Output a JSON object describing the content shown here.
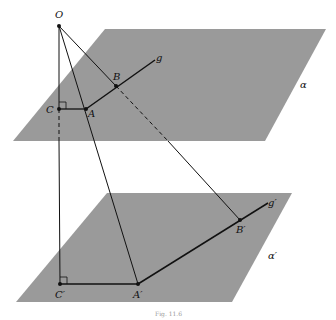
{
  "figure": {
    "caption": "Fig. 11.6",
    "colors": {
      "plane": "#9a9a9a",
      "line": "#111111",
      "background": "#ffffff"
    },
    "planes": [
      {
        "name": "α",
        "points": "105,29 326,29 265,141 13,141"
      },
      {
        "name": "α′",
        "points": "107,193 292,193 232,302 16,302"
      }
    ],
    "points": {
      "O": {
        "label": "O",
        "x": 59,
        "y": 26
      },
      "C": {
        "label": "C",
        "x": 59,
        "y": 109
      },
      "A": {
        "label": "A",
        "x": 86,
        "y": 109
      },
      "B": {
        "label": "B",
        "x": 116,
        "y": 86
      },
      "C_prime": {
        "label": "C′",
        "x": 60,
        "y": 284
      },
      "A_prime": {
        "label": "A′",
        "x": 138,
        "y": 284
      },
      "B_prime": {
        "label": "B′",
        "x": 240,
        "y": 220
      }
    },
    "lines": {
      "g": "g",
      "g_prime": "g′"
    }
  }
}
